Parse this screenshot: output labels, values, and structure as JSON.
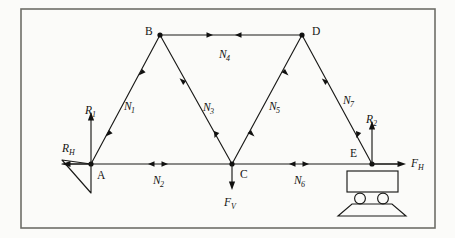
{
  "figure": {
    "type": "statics-truss-diagram",
    "frame": {
      "x": 21,
      "y": 9,
      "width": 414,
      "height": 219,
      "stroke": "#6e6e68",
      "stroke_width": 1.6
    },
    "canvas": {
      "width": 455,
      "height": 238,
      "background": "#fbfbf9"
    },
    "ink_color": "#1a1a18",
    "line_width": 1.1
  },
  "nodes": [
    {
      "id": "A",
      "label": "A",
      "x": 91,
      "y": 164,
      "label_x": 97,
      "label_y": 178,
      "dot": true
    },
    {
      "id": "B",
      "label": "B",
      "x": 160,
      "y": 35,
      "label_x": 146,
      "label_y": 33,
      "dot": true
    },
    {
      "id": "C",
      "label": "C",
      "x": 232,
      "y": 164,
      "label_x": 241,
      "label_y": 177,
      "dot": true
    },
    {
      "id": "D",
      "label": "D",
      "x": 302,
      "y": 35,
      "label_x": 312,
      "label_y": 33,
      "dot": true
    },
    {
      "id": "E",
      "label": "E",
      "x": 372,
      "y": 164,
      "label_x": 351,
      "label_y": 155,
      "dot": true
    }
  ],
  "members": [
    {
      "id": "N1",
      "label": "N",
      "subscript": "1",
      "from": "A",
      "to": "B",
      "label_x": 126,
      "label_y": 106,
      "arrow_mode": "double-outward"
    },
    {
      "id": "N2",
      "label": "N",
      "subscript": "2",
      "from": "A",
      "to": "C",
      "label_x": 155,
      "label_y": 182,
      "arrow_mode": "double-outward"
    },
    {
      "id": "N3",
      "label": "N",
      "subscript": "3",
      "from": "B",
      "to": "C",
      "label_x": 205,
      "label_y": 107,
      "arrow_mode": "double-outward"
    },
    {
      "id": "N4",
      "label": "N",
      "subscript": "4",
      "from": "B",
      "to": "D",
      "label_x": 226,
      "label_y": 54,
      "arrow_mode": "double-inward"
    },
    {
      "id": "N5",
      "label": "N",
      "subscript": "5",
      "from": "C",
      "to": "D",
      "label_x": 271,
      "label_y": 106,
      "arrow_mode": "double-outward"
    },
    {
      "id": "N6",
      "label": "N",
      "subscript": "6",
      "from": "C",
      "to": "E",
      "label_x": 296,
      "label_y": 182,
      "arrow_mode": "double-outward"
    },
    {
      "id": "N7",
      "label": "N",
      "subscript": "7",
      "from": "D",
      "to": "E",
      "label_x": 345,
      "label_y": 100,
      "arrow_mode": "double-outward"
    }
  ],
  "forces": [
    {
      "id": "R1",
      "label": "R",
      "subscript": "1",
      "at": "A",
      "direction": "up",
      "length": 52,
      "label_x": 91,
      "label_y": 116,
      "kind": "reaction-vertical-left"
    },
    {
      "id": "RH",
      "label": "R",
      "subscript": "H",
      "at": "A",
      "direction": "left",
      "length": 30,
      "label_x": 74,
      "label_y": 150,
      "kind": "reaction-horizontal-left"
    },
    {
      "id": "FV",
      "label": "F",
      "subscript": "V",
      "at": "C",
      "direction": "down",
      "length": 26,
      "label_x": 232,
      "label_y": 203,
      "kind": "applied-load-vertical"
    },
    {
      "id": "R2",
      "label": "R",
      "subscript": "2",
      "at": "E",
      "direction": "up",
      "length": 44,
      "label_x": 372,
      "label_y": 119,
      "kind": "reaction-vertical-right"
    },
    {
      "id": "FH",
      "label": "F",
      "subscript": "H",
      "at": "E",
      "direction": "right",
      "length": 32,
      "label_x": 416,
      "label_y": 164,
      "kind": "applied-load-horizontal"
    }
  ],
  "supports": [
    {
      "id": "pin-support-A",
      "type": "pin",
      "at": "A",
      "apex_x": 91,
      "apex_y": 164,
      "left_x": 62,
      "left_y": 160,
      "bottom_x": 91,
      "bottom_y": 193
    },
    {
      "id": "roller-support-E",
      "type": "roller",
      "at": "E",
      "body": {
        "x": 347,
        "y": 171,
        "width": 51,
        "height": 21
      },
      "wheels": [
        {
          "cx": 360,
          "cy": 198,
          "r": 5.5
        },
        {
          "cx": 383,
          "cy": 198,
          "r": 5.5
        }
      ],
      "base": {
        "top_left_x": 352,
        "top_right_x": 392,
        "bottom_left_x": 338,
        "bottom_right_x": 406,
        "top_y": 204,
        "bottom_y": 216
      }
    }
  ],
  "member_tick_marks": {
    "description": "small solid arrowheads placed along each member indicating force sense",
    "offset_from_node": 0.26
  }
}
